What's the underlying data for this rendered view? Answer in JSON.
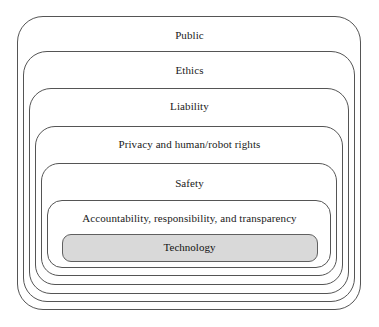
{
  "diagram": {
    "type": "nested-layers",
    "title": "",
    "background_color": "#ffffff",
    "layer_border_color": "#555555",
    "core_fill_color": "#d9d9d9",
    "core_border_color": "#606060",
    "layers": [
      {
        "label": "Public"
      },
      {
        "label": "Ethics"
      },
      {
        "label": "Liability"
      },
      {
        "label": "Privacy and human/robot rights"
      },
      {
        "label": "Safety"
      },
      {
        "label": "Accountability, responsibility, and transparency"
      }
    ],
    "core": {
      "label": "Technology"
    }
  }
}
